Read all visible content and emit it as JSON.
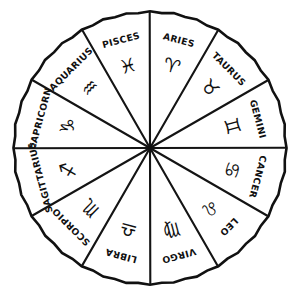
{
  "figure": {
    "shape": "circle divided into twelve equal sectors",
    "center_x": 150,
    "center_y": 148,
    "radius": 136,
    "ink_color": "#111111",
    "background_color": "#ffffff",
    "sector_count": 12
  },
  "chart_data": {
    "type": "pie",
    "xlabel": "",
    "ylabel": "",
    "legend_position": "none",
    "grid": false,
    "categories": [
      "ARIES",
      "TAURUS",
      "GEMINI",
      "CANCER",
      "LEO",
      "VIRGO",
      "LIBRA",
      "SCORPIO",
      "SAGITTARIUS",
      "CAPRICORN",
      "AQUARIUS",
      "PISCES"
    ],
    "values": [
      30,
      30,
      30,
      30,
      30,
      30,
      30,
      30,
      30,
      30,
      30,
      30
    ],
    "value_unit": "degrees",
    "labels": [
      "ARIES",
      "TAURUS",
      "GEMINI",
      "CANCER",
      "LEO",
      "VIRGO",
      "LIBRA",
      "SCORPIO",
      "SAGITTARIUS",
      "CAPRICORN",
      "AQUARIUS",
      "PISCES"
    ],
    "glyphs": [
      "♈",
      "♉",
      "♊",
      "♋",
      "♌",
      "♍",
      "♎",
      "♏",
      "♐",
      "♑",
      "♒",
      "♓"
    ]
  },
  "sectors": [
    {
      "name": "ARIES",
      "glyph": "♈",
      "mid_angle": -75,
      "name_rotation": 15,
      "name_radius": 111,
      "glyph_radius": 84,
      "glyph_rotation": 15
    },
    {
      "name": "TAURUS",
      "glyph": "♉",
      "mid_angle": -45,
      "name_rotation": 45,
      "name_radius": 111,
      "glyph_radius": 84,
      "glyph_rotation": 45
    },
    {
      "name": "GEMINI",
      "glyph": "♊",
      "mid_angle": -15,
      "name_rotation": 75,
      "name_radius": 111,
      "glyph_radius": 84,
      "glyph_rotation": 75
    },
    {
      "name": "CANCER",
      "glyph": "♋",
      "mid_angle": 15,
      "name_rotation": 105,
      "name_radius": 111,
      "glyph_radius": 84,
      "glyph_rotation": 105
    },
    {
      "name": "LEO",
      "glyph": "♌",
      "mid_angle": 45,
      "name_rotation": 135,
      "name_radius": 111,
      "glyph_radius": 84,
      "glyph_rotation": 135
    },
    {
      "name": "VIRGO",
      "glyph": "♍",
      "mid_angle": 75,
      "name_rotation": 165,
      "name_radius": 111,
      "glyph_radius": 84,
      "glyph_rotation": 165
    },
    {
      "name": "LIBRA",
      "glyph": "♎",
      "mid_angle": 105,
      "name_rotation": 195,
      "name_radius": 111,
      "glyph_radius": 84,
      "glyph_rotation": 195
    },
    {
      "name": "SCORPIO",
      "glyph": "♏",
      "mid_angle": 135,
      "name_rotation": 225,
      "name_radius": 111,
      "glyph_radius": 84,
      "glyph_rotation": 225
    },
    {
      "name": "SAGITTARIUS",
      "glyph": "♐",
      "mid_angle": 165,
      "name_rotation": 255,
      "name_radius": 113,
      "glyph_radius": 84,
      "glyph_rotation": 255
    },
    {
      "name": "CAPRICORN",
      "glyph": "♑",
      "mid_angle": -165,
      "name_rotation": 285,
      "name_radius": 113,
      "glyph_radius": 84,
      "glyph_rotation": 285
    },
    {
      "name": "AQUARIUS",
      "glyph": "♒",
      "mid_angle": -135,
      "name_rotation": 315,
      "name_radius": 111,
      "glyph_radius": 84,
      "glyph_rotation": 315
    },
    {
      "name": "PISCES",
      "glyph": "♓",
      "mid_angle": -105,
      "name_rotation": 345,
      "name_radius": 111,
      "glyph_radius": 84,
      "glyph_rotation": 345
    }
  ]
}
